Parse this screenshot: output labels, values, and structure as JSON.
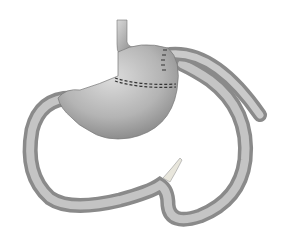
{
  "figure": {
    "parts": [
      "esophagus",
      "gastric-pouch",
      "staple-line",
      "gastrojejunal-anastomosis",
      "roux-limb",
      "bypassed-stomach",
      "duodenum",
      "appendage"
    ],
    "colors": {
      "background": "#ffffff",
      "tissue_light": "#d4d4d4",
      "tissue_mid": "#a8a8a8",
      "tissue_dark": "#6e6e6e",
      "staple": "#333333",
      "appendage": "#e8e6dc"
    }
  }
}
